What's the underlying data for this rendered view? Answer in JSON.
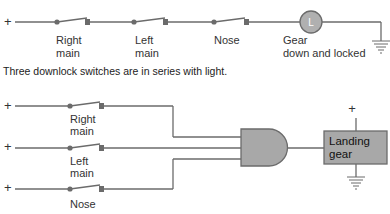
{
  "diagram": {
    "top_circuit": {
      "supply_symbol": "+",
      "switches": [
        {
          "label_line1": "Right",
          "label_line2": "main"
        },
        {
          "label_line1": "Left",
          "label_line2": "main"
        },
        {
          "label_line1": "Nose",
          "label_line2": ""
        }
      ],
      "light": {
        "symbol": "L",
        "label_line1": "Gear",
        "label_line2": "down and locked"
      },
      "caption": "Three downlock switches are in series with light."
    },
    "bottom_circuit": {
      "inputs": [
        {
          "supply_symbol": "+",
          "label_line1": "Right",
          "label_line2": "main"
        },
        {
          "supply_symbol": "+",
          "label_line1": "Left",
          "label_line2": "main"
        },
        {
          "supply_symbol": "+",
          "label_line1": "Nose",
          "label_line2": ""
        }
      ],
      "gate": "AND",
      "output_box": {
        "label_line1": "Landing",
        "label_line2": "gear",
        "supply_symbol": "+"
      }
    },
    "colors": {
      "wire": "#6b6b6b",
      "fill": "#a8a8a8",
      "background": "#ffffff"
    }
  }
}
